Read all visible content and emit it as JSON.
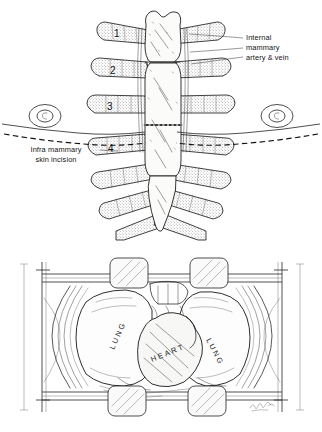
{
  "figure": {
    "background_color": "#ffffff",
    "ink_color": "#111111"
  },
  "panels": {
    "top": {
      "name": "anterior-chest-wall-anatomy",
      "labels": {
        "internal_mammary": "Internal\nmammary\nartery & vein",
        "internal_mammary_line1": "Internal",
        "internal_mammary_line2": "mammary",
        "internal_mammary_line3": "artery & vein",
        "incision_line1": "Infra mammary",
        "incision_line2": "skin incision"
      },
      "rib_numbers": [
        "1",
        "2",
        "3",
        "4"
      ],
      "structures": [
        "manubrium",
        "sternum-body",
        "xiphoid-process",
        "costal-cartilage",
        "ribs",
        "nipple-areola-left",
        "nipple-areola-right",
        "inframammary-crease",
        "transverse-sternotomy-line"
      ]
    },
    "bottom": {
      "name": "retracted-thoracic-cavity",
      "labels": {
        "lung_left": "LUNG",
        "lung_right": "LUNG",
        "heart": "HEART"
      },
      "structures": [
        "retractor-frame",
        "retractor-rail-upper",
        "retractor-rail-lower",
        "retractor-post-left",
        "retractor-post-right",
        "retractor-blade-top-left",
        "retractor-blade-top-right",
        "retractor-blade-bottom-left",
        "retractor-blade-bottom-right",
        "chest-wall-edge",
        "thymus-remnant"
      ],
      "signature": "artist signature"
    }
  }
}
